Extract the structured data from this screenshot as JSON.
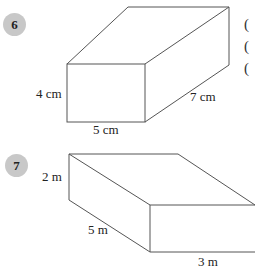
{
  "problems": [
    {
      "number": "6",
      "shape": "cuboid",
      "labels": {
        "height": "4 cm",
        "width": "5 cm",
        "depth": "7 cm"
      }
    },
    {
      "number": "7",
      "shape": "cuboid",
      "labels": {
        "height": "2 m",
        "depth": "5 m",
        "width": "3 m"
      }
    }
  ],
  "side_markers": [
    "(",
    "(",
    "("
  ],
  "colors": {
    "badge": "#c8c8c8",
    "line": "#555555"
  }
}
